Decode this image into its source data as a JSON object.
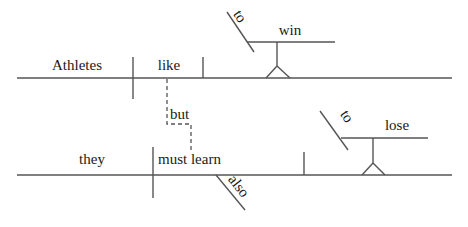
{
  "diagram": {
    "type": "Reed-Kellogg sentence diagram",
    "sentence": "Athletes like to win, but they also must learn to lose.",
    "clause1": {
      "subject": "Athletes",
      "verb": "like",
      "object_infinitive": {
        "marker": "to",
        "verb": "win"
      }
    },
    "conjunction": "but",
    "clause2": {
      "subject": "they",
      "verb": "must learn",
      "modifier": "also",
      "object_infinitive": {
        "marker": "to",
        "verb": "lose"
      }
    }
  },
  "colors": {
    "line": "#555555",
    "text": "#1a1a1a",
    "background": "#ffffff"
  }
}
